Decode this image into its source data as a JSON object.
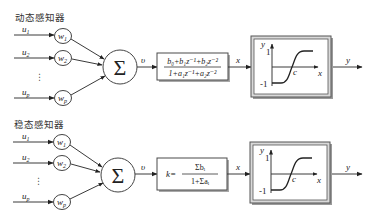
{
  "diagrams": [
    {
      "title": "动态感知器",
      "inputs": [
        {
          "u": {
            "base": "u",
            "sub": "1"
          },
          "w": {
            "base": "w",
            "sub": "1"
          }
        },
        {
          "u": {
            "base": "u",
            "sub": "2"
          },
          "w": {
            "base": "w",
            "sub": "2"
          }
        },
        {
          "u": {
            "base": "u",
            "sub": "p"
          },
          "w": {
            "base": "w",
            "sub": "p"
          }
        }
      ],
      "ellipsis": "⋮",
      "summation_symbol": "Σ",
      "sum_output_label": "υ",
      "transfer_block": {
        "numerator": "b₀+b₁z⁻¹+b₂z⁻²",
        "denominator": "1+a₁z⁻¹+a₂z⁻²"
      },
      "transfer_output_label": "x",
      "activation_block": {
        "y_axis_label": "y",
        "x_axis_label": "x",
        "upper_value": "1",
        "lower_value": "-1",
        "center_label": "c"
      },
      "output_label": "y"
    },
    {
      "title": "稳态感知器",
      "inputs": [
        {
          "u": {
            "base": "u",
            "sub": "1"
          },
          "w": {
            "base": "w",
            "sub": "1"
          }
        },
        {
          "u": {
            "base": "u",
            "sub": "2"
          },
          "w": {
            "base": "w",
            "sub": "2"
          }
        },
        {
          "u": {
            "base": "u",
            "sub": "p"
          },
          "w": {
            "base": "w",
            "sub": "p"
          }
        }
      ],
      "ellipsis": "⋮",
      "summation_symbol": "Σ",
      "sum_output_label": "υ",
      "gain_block": {
        "prefix": "k=",
        "numerator": "Σbᵢ",
        "denominator": "1+Σaᵢ"
      },
      "transfer_output_label": "x",
      "activation_block": {
        "y_axis_label": "y",
        "x_axis_label": "x",
        "upper_value": "1",
        "lower_value": "-1",
        "center_label": "c"
      },
      "output_label": "y"
    }
  ],
  "colors": {
    "line": "#3a3a3a",
    "box_shadow": "#9a9a9a",
    "frame_fill": "#d9d9d9"
  }
}
